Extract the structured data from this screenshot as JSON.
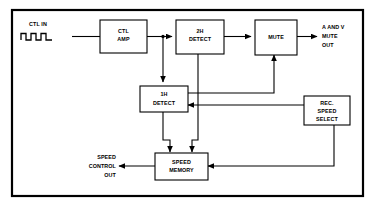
{
  "diagram": {
    "type": "block-diagram",
    "frame": {
      "stroke": "#000000",
      "fill": "#ffffff"
    },
    "blocks": [
      {
        "id": "ctl-amp",
        "lines": [
          "CTL",
          "AMP"
        ]
      },
      {
        "id": "2h-detect",
        "lines": [
          "2H",
          "DETECT"
        ]
      },
      {
        "id": "mute",
        "lines": [
          "MUTE"
        ]
      },
      {
        "id": "1h-detect",
        "lines": [
          "1H",
          "DETECT"
        ]
      },
      {
        "id": "rec-speed-select",
        "lines": [
          "REC.",
          "SPEED",
          "SELECT"
        ]
      },
      {
        "id": "speed-memory",
        "lines": [
          "SPEED",
          "MEMORY"
        ]
      }
    ],
    "io_labels": [
      {
        "id": "ctl-in",
        "lines": [
          "CTL IN"
        ]
      },
      {
        "id": "a-and-v-mute-out",
        "lines": [
          "A AND V",
          "MUTE",
          "OUT"
        ]
      },
      {
        "id": "speed-control-out",
        "lines": [
          "SPEED",
          "CONTROL",
          "OUT"
        ]
      }
    ],
    "waveform": {
      "id": "ctl-in-waveform",
      "description": "square pulse train, two pulses"
    },
    "signal_flow": [
      "CTL IN waveform -> CTL AMP",
      "CTL AMP -> junction -> 2H DETECT",
      "junction -> 1H DETECT (down)",
      "2H DETECT -> MUTE",
      "MUTE -> A AND V MUTE OUT",
      "2H DETECT -> SPEED MEMORY (down)",
      "1H DETECT -> MUTE (up)",
      "1H DETECT -> SPEED MEMORY (down)",
      "REC. SPEED SELECT -> 1H DETECT",
      "REC. SPEED SELECT -> SPEED MEMORY",
      "SPEED MEMORY -> SPEED CONTROL OUT"
    ]
  }
}
